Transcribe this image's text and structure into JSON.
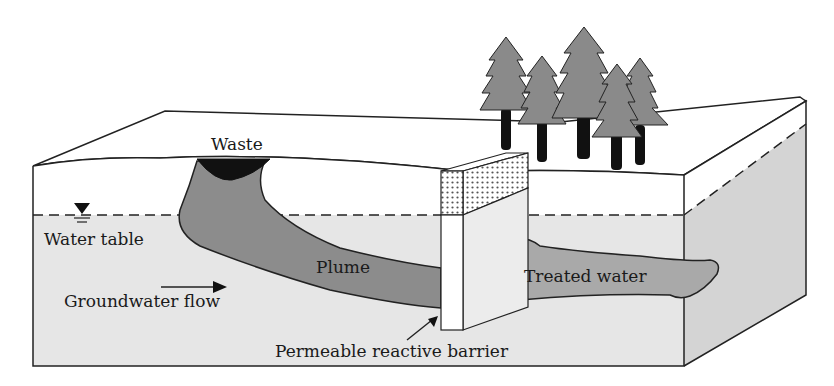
{
  "diagram": {
    "labels": {
      "waste": "Waste",
      "water_table": "Water table",
      "groundwater_flow": "Groundwater flow",
      "plume": "Plume",
      "treated_water": "Treated water",
      "barrier": "Permeable reactive barrier"
    },
    "icons": {
      "water_table_symbol": "inverted-triangle-icon",
      "flow_arrow": "arrow-right-icon",
      "barrier_pointer": "arrow-up-right-icon",
      "trees": "conifer-tree-icon"
    },
    "colors": {
      "outline": "#222222",
      "saturated_zone": "#e6e6e6",
      "side_saturated": "#d4d4d4",
      "plume": "#8c8c8c",
      "treated_water": "#a9a9a9",
      "waste": "#111111",
      "tree_foliage": "#8a8a8a",
      "tree_trunk": "#111111",
      "barrier_stipple": "#555555"
    }
  }
}
